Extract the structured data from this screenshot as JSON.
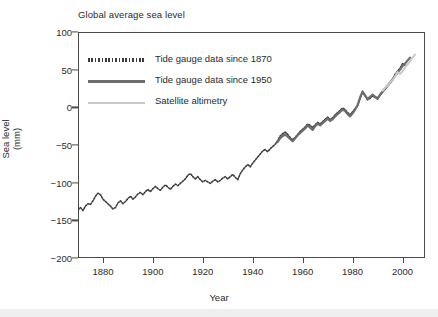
{
  "chart_data": {
    "type": "line",
    "title": "Global average sea level",
    "xlabel": "Year",
    "ylabel": "Sea level (mm)",
    "ylabel_line1": "Sea level",
    "ylabel_line2": "(mm)",
    "xlim": [
      1870,
      2009
    ],
    "ylim": [
      -200,
      100
    ],
    "xticks": [
      1880,
      1900,
      1920,
      1940,
      1960,
      1980,
      2000
    ],
    "xtick_labels": [
      "1880",
      "1900",
      "1920",
      "1940",
      "1960",
      "1980",
      "2000"
    ],
    "yticks": [
      100,
      50,
      0,
      -50,
      -100,
      -150,
      -200
    ],
    "ytick_labels": [
      "100",
      "50",
      "0",
      "−50",
      "−100",
      "−150",
      "−200"
    ],
    "grid": false,
    "legend_position": "upper left",
    "colors": {
      "tide_1870": "#3c3c3c",
      "tide_1950": "#6d6d6d",
      "satellite": "#c9c9c9",
      "axis": "#4a4a4a",
      "text": "#2b2b2b",
      "background": "#ffffff"
    },
    "series": [
      {
        "name": "Tide gauge data since 1870",
        "style": "dotted",
        "color": "#3c3c3c",
        "x": [
          1870,
          1871,
          1872,
          1873,
          1874,
          1875,
          1876,
          1877,
          1878,
          1879,
          1880,
          1881,
          1882,
          1883,
          1884,
          1885,
          1886,
          1887,
          1888,
          1889,
          1890,
          1891,
          1892,
          1893,
          1894,
          1895,
          1896,
          1897,
          1898,
          1899,
          1900,
          1901,
          1902,
          1903,
          1904,
          1905,
          1906,
          1907,
          1908,
          1909,
          1910,
          1911,
          1912,
          1913,
          1914,
          1915,
          1916,
          1917,
          1918,
          1919,
          1920,
          1921,
          1922,
          1923,
          1924,
          1925,
          1926,
          1927,
          1928,
          1929,
          1930,
          1931,
          1932,
          1933,
          1934,
          1935,
          1936,
          1937,
          1938,
          1939,
          1940,
          1941,
          1942,
          1943,
          1944,
          1945,
          1946,
          1947,
          1948,
          1949,
          1950,
          1951,
          1952,
          1953,
          1954,
          1955,
          1956,
          1957,
          1958,
          1959,
          1960,
          1961,
          1962,
          1963,
          1964,
          1965,
          1966,
          1967,
          1968,
          1969,
          1970,
          1971,
          1972,
          1973,
          1974,
          1975,
          1976,
          1977,
          1978,
          1979,
          1980,
          1981,
          1982,
          1983,
          1984,
          1985,
          1986,
          1987,
          1988,
          1989,
          1990,
          1991,
          1992,
          1993,
          1994,
          1995,
          1996,
          1997,
          1998,
          1999,
          2000,
          2001
        ],
        "y": [
          -136,
          -133,
          -137,
          -131,
          -128,
          -129,
          -124,
          -118,
          -114,
          -116,
          -122,
          -125,
          -128,
          -131,
          -135,
          -133,
          -127,
          -124,
          -128,
          -125,
          -121,
          -118,
          -122,
          -119,
          -115,
          -113,
          -116,
          -112,
          -109,
          -112,
          -108,
          -105,
          -108,
          -110,
          -106,
          -103,
          -106,
          -109,
          -105,
          -102,
          -104,
          -101,
          -98,
          -95,
          -90,
          -88,
          -92,
          -95,
          -92,
          -96,
          -99,
          -97,
          -99,
          -101,
          -98,
          -96,
          -99,
          -97,
          -94,
          -92,
          -95,
          -92,
          -89,
          -93,
          -96,
          -88,
          -83,
          -79,
          -76,
          -79,
          -74,
          -70,
          -66,
          -62,
          -58,
          -56,
          -59,
          -55,
          -52,
          -49,
          -44,
          -38,
          -35,
          -33,
          -36,
          -40,
          -43,
          -40,
          -36,
          -32,
          -29,
          -26,
          -22,
          -24,
          -27,
          -23,
          -20,
          -22,
          -19,
          -16,
          -13,
          -16,
          -14,
          -10,
          -7,
          -4,
          -1,
          -3,
          -7,
          -10,
          -6,
          -2,
          2,
          12,
          20,
          15,
          10,
          12,
          15,
          13,
          11,
          16,
          20,
          24,
          28,
          32,
          36,
          44,
          48,
          52,
          58,
          56
        ]
      },
      {
        "name": "Tide gauge data since 1950",
        "style": "solid",
        "color": "#6d6d6d",
        "x": [
          1950,
          1951,
          1952,
          1953,
          1954,
          1955,
          1956,
          1957,
          1958,
          1959,
          1960,
          1961,
          1962,
          1963,
          1964,
          1965,
          1966,
          1967,
          1968,
          1969,
          1970,
          1971,
          1972,
          1973,
          1974,
          1975,
          1976,
          1977,
          1978,
          1979,
          1980,
          1981,
          1982,
          1983,
          1984,
          1985,
          1986,
          1987,
          1988,
          1989,
          1990,
          1991,
          1992,
          1993,
          1994,
          1995,
          1996,
          1997,
          1998,
          1999,
          2000,
          2001,
          2002,
          2003
        ],
        "y": [
          -46,
          -41,
          -38,
          -36,
          -39,
          -42,
          -45,
          -41,
          -37,
          -34,
          -31,
          -28,
          -24,
          -27,
          -30,
          -25,
          -22,
          -24,
          -21,
          -18,
          -15,
          -18,
          -16,
          -12,
          -9,
          -6,
          -3,
          -5,
          -9,
          -12,
          -8,
          -3,
          3,
          13,
          21,
          16,
          11,
          14,
          17,
          14,
          12,
          17,
          21,
          25,
          29,
          33,
          37,
          42,
          46,
          50,
          55,
          58,
          62,
          66
        ]
      },
      {
        "name": "Satellite altimetry",
        "style": "solid",
        "color": "#c9c9c9",
        "x": [
          1992,
          1993,
          1994,
          1995,
          1996,
          1997,
          1998,
          1999,
          2000,
          2001,
          2002,
          2003,
          2004,
          2005
        ],
        "y": [
          22,
          26,
          29,
          33,
          36,
          41,
          47,
          44,
          48,
          53,
          57,
          61,
          66,
          70
        ]
      }
    ]
  }
}
